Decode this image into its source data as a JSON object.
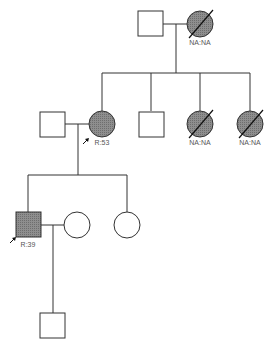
{
  "diagram": {
    "type": "pedigree",
    "colors": {
      "line": "#333333",
      "affected_fill": "#8a8a8a",
      "unaffected_fill": "#ffffff",
      "label": "#555555"
    },
    "generations": [
      {
        "id": "I",
        "individuals": [
          {
            "id": "I-1",
            "sex": "male",
            "affected": false,
            "deceased": false,
            "label": ""
          },
          {
            "id": "I-2",
            "sex": "female",
            "affected": true,
            "deceased": true,
            "label": "NA:NA"
          }
        ]
      },
      {
        "id": "II",
        "individuals": [
          {
            "id": "II-spouse",
            "sex": "male",
            "affected": false,
            "deceased": false,
            "label": ""
          },
          {
            "id": "II-1",
            "sex": "female",
            "affected": true,
            "deceased": false,
            "proband_arrow": true,
            "label": "R:53"
          },
          {
            "id": "II-2",
            "sex": "male",
            "affected": false,
            "deceased": false,
            "label": ""
          },
          {
            "id": "II-3",
            "sex": "female",
            "affected": true,
            "deceased": true,
            "label": "NA:NA"
          },
          {
            "id": "II-4",
            "sex": "female",
            "affected": true,
            "deceased": true,
            "label": "NA:NA"
          }
        ]
      },
      {
        "id": "III",
        "individuals": [
          {
            "id": "III-1",
            "sex": "male",
            "affected": true,
            "deceased": false,
            "proband_arrow": true,
            "label": "R:39"
          },
          {
            "id": "III-spouse",
            "sex": "female",
            "affected": false,
            "deceased": false,
            "label": ""
          },
          {
            "id": "III-2",
            "sex": "female",
            "affected": false,
            "deceased": false,
            "label": ""
          }
        ]
      },
      {
        "id": "IV",
        "individuals": [
          {
            "id": "IV-1",
            "sex": "male",
            "affected": false,
            "deceased": false,
            "label": ""
          }
        ]
      }
    ],
    "labels": {
      "i2": "NA:NA",
      "ii1": "R:53",
      "ii3": "NA:NA",
      "ii4": "NA:NA",
      "iii1": "R:39"
    }
  }
}
